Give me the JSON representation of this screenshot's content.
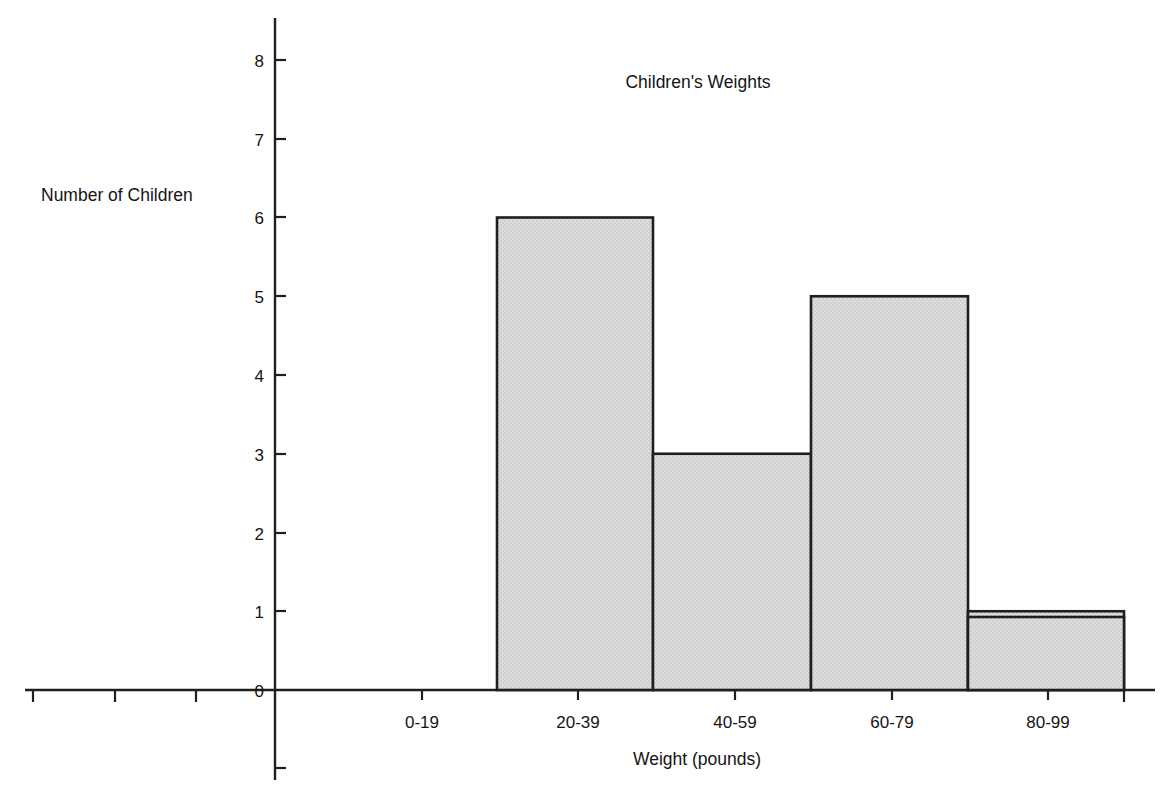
{
  "chart_data": {
    "type": "bar",
    "title": "Children's Weights",
    "xlabel": "Weight (pounds)",
    "ylabel": "Number of Children",
    "categories": [
      "0-19",
      "20-39",
      "40-59",
      "60-79",
      "80-99"
    ],
    "values": [
      4,
      6,
      3,
      5,
      1
    ],
    "series": [
      {
        "name": "Number of Children",
        "values": [
          4,
          6,
          3,
          5,
          1
        ]
      }
    ],
    "ylim": [
      0,
      8
    ],
    "ytick_labels": [
      "0",
      "1",
      "2",
      "3",
      "4",
      "5",
      "6",
      "7",
      "8"
    ],
    "ytick_values": [
      0,
      1,
      2,
      3,
      4,
      5,
      6,
      7,
      8
    ],
    "grid": false,
    "legend": "none",
    "bar_style": "histogram-adjacent",
    "bar_fill_color": "#d9d9d9",
    "bar_edge_color": "#1f1f1f",
    "axis_color": "#1f1f1f",
    "background_color": "#ffffff"
  },
  "bars": [
    {
      "category": "0-19",
      "value": 4,
      "value_label": "4"
    },
    {
      "category": "20-39",
      "value": 6,
      "value_label": "6"
    },
    {
      "category": "40-59",
      "value": 3,
      "value_label": "3"
    },
    {
      "category": "60-79",
      "value": 5,
      "value_label": "5"
    },
    {
      "category": "80-99",
      "value": 1,
      "value_label": "1"
    }
  ],
  "yticks": [
    {
      "label": "8"
    },
    {
      "label": "7"
    },
    {
      "label": "6"
    },
    {
      "label": "5"
    },
    {
      "label": "4"
    },
    {
      "label": "3"
    },
    {
      "label": "2"
    },
    {
      "label": "1"
    },
    {
      "label": "0"
    }
  ],
  "xticks": [
    {
      "label": "0-19"
    },
    {
      "label": "20-39"
    },
    {
      "label": "40-59"
    },
    {
      "label": "60-79"
    },
    {
      "label": "80-99"
    }
  ],
  "labels": {
    "title": "Children's Weights",
    "x_axis_title": "Weight (pounds)",
    "y_axis_title": "Number of Children"
  }
}
